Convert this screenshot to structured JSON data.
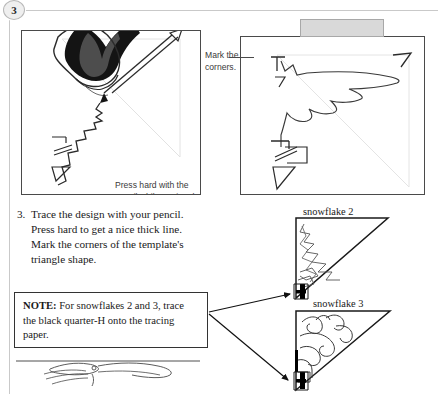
{
  "page": {
    "step_number": "3",
    "background_color": "#ffffff",
    "frame_color": "#c9c9c9"
  },
  "photos": {
    "left": {
      "name": "tracing-photo",
      "caption": "Press hard with the\npencil while tracing the"
    },
    "right": {
      "name": "marked-corners-photo",
      "gray_tab_color": "#d9d9d9"
    }
  },
  "annotations": {
    "mark_corners": "Mark the\ncorners."
  },
  "instruction": {
    "number": "3.",
    "text": "Trace the design with your pencil. Press hard to get a nice thick line. Mark the corners of the template's triangle shape."
  },
  "note": {
    "label": "NOTE:",
    "text": " For snowflakes 2 and 3, trace the black quarter-H onto the tracing paper."
  },
  "snowflakes": [
    {
      "label": "snowflake 2"
    },
    {
      "label": "snowflake 3"
    }
  ]
}
